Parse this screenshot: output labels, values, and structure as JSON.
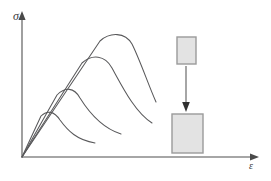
{
  "figure": {
    "background_color": "#ffffff"
  },
  "axes": {
    "y_label": "σ",
    "x_label": "ε",
    "y_label_name": "sigma",
    "x_label_name": "epsilon",
    "origin": [
      22,
      157
    ],
    "y_axis_top": [
      22,
      14
    ],
    "x_axis_right": [
      258,
      157
    ],
    "axis_color": "#888888",
    "grid": false
  },
  "chart_data": {
    "type": "line",
    "title": "",
    "xlabel": "ε",
    "ylabel": "σ",
    "xlim": [
      0,
      1
    ],
    "ylim": [
      0,
      1
    ],
    "grid": false,
    "legend": "none",
    "note": "Four stress-strain curves sharing a common linear elastic loading line from the origin; each departs at a progressively higher point, peaks, then softens down a descending branch.",
    "series": [
      {
        "name": "curve-1-lowest",
        "path": "M 22 157 L 41 116 C 47 110 54 111 60 120 C 68 131 77 140 95 143",
        "peak": [
          48,
          113
        ],
        "end": [
          95,
          143
        ],
        "values": [
          [
            0.0,
            0.0
          ],
          [
            0.08,
            0.29
          ],
          [
            0.16,
            0.32
          ],
          [
            0.26,
            0.26
          ],
          [
            0.38,
            0.16
          ],
          [
            0.52,
            0.1
          ],
          [
            0.62,
            0.1
          ]
        ]
      },
      {
        "name": "curve-2",
        "path": "M 22 157 L 57 95 C 65 87 74 87 80 98 C 90 114 102 128 121 134",
        "peak": [
          69,
          88
        ],
        "end": [
          121,
          134
        ],
        "values": [
          [
            0.0,
            0.0
          ],
          [
            0.15,
            0.44
          ],
          [
            0.24,
            0.5
          ],
          [
            0.34,
            0.43
          ],
          [
            0.48,
            0.29
          ],
          [
            0.63,
            0.18
          ],
          [
            0.8,
            0.16
          ]
        ]
      },
      {
        "name": "curve-3",
        "path": "M 22 157 L 82 63 C 92 54 105 55 112 68 C 123 88 135 112 152 123",
        "peak": [
          98,
          56
        ],
        "end": [
          152,
          123
        ],
        "values": [
          [
            0.0,
            0.0
          ],
          [
            0.27,
            0.68
          ],
          [
            0.35,
            0.73
          ],
          [
            0.45,
            0.64
          ],
          [
            0.6,
            0.45
          ],
          [
            0.75,
            0.28
          ],
          [
            0.98,
            0.23
          ]
        ]
      },
      {
        "name": "curve-4-highest",
        "path": "M 22 157 L 100 41 C 110 32 125 32 132 44 C 140 60 148 84 156 102",
        "peak": [
          118,
          34
        ],
        "end": [
          156,
          102
        ],
        "values": [
          [
            0.0,
            0.0
          ],
          [
            0.36,
            0.83
          ],
          [
            0.44,
            0.88
          ],
          [
            0.52,
            0.8
          ],
          [
            0.62,
            0.63
          ],
          [
            0.7,
            0.47
          ],
          [
            0.77,
            0.39
          ]
        ]
      }
    ]
  },
  "specimens": {
    "upper": {
      "label_name": "specimen-before",
      "x": 177,
      "y": 37,
      "width": 19,
      "height": 27,
      "fill_color": "#e3e3e3",
      "stroke_color": "#9a9a9a"
    },
    "lower": {
      "label_name": "specimen-after",
      "x": 172,
      "y": 114,
      "width": 31,
      "height": 39,
      "fill_color": "#e3e3e3",
      "stroke_color": "#9a9a9a"
    },
    "arrow": {
      "label_name": "deformation-arrow",
      "from": [
        186,
        66
      ],
      "to": [
        186,
        111
      ],
      "color": "#6b6b6b"
    }
  }
}
